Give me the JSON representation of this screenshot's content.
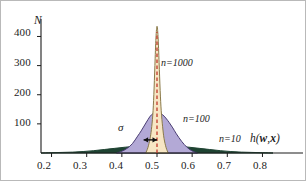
{
  "figure": {
    "background_color": "#ffffff",
    "border_color": "#b9b9b9",
    "axis_color": "#1c1c1c"
  },
  "axes": {
    "y_label": "N",
    "x_label_html": "h(<b>w</b>,<b>x</b>)",
    "x_label_text": "h(w,x)",
    "y_ticks": [
      "100",
      "200",
      "300",
      "400"
    ],
    "x_ticks": [
      "0.2",
      "0.3",
      "0.4",
      "0.5",
      "0.6",
      "0.7",
      "0.8"
    ]
  },
  "annotations": {
    "sigma": "σ",
    "sigma_arrow": "double-headed-arrow",
    "mean_line": "dashed-vertical-line-at-0.5",
    "mean_line_color": "#c0392b"
  },
  "series_labels": {
    "n1000": "n=1000",
    "n100": "n=100",
    "n10": "n=10"
  },
  "chart_data": {
    "type": "area",
    "title": "",
    "subtitle": "",
    "xlabel": "h(w,x)",
    "ylabel": "N",
    "xlim": [
      0.17,
      0.83
    ],
    "ylim": [
      0,
      460
    ],
    "x_ticks": [
      0.2,
      0.3,
      0.4,
      0.5,
      0.6,
      0.7,
      0.8
    ],
    "y_ticks": [
      100,
      200,
      300,
      400
    ],
    "grid": false,
    "legend": "inline-annotations",
    "mean": 0.5,
    "annotations": [
      {
        "text": "σ",
        "x": 0.448,
        "y": 75,
        "note": "standard deviation marker with double arrow from 0.462 to 0.500 at y=45"
      },
      {
        "text": "n=1000",
        "x": 0.545,
        "y": 330
      },
      {
        "text": "n=100",
        "x": 0.605,
        "y": 125
      },
      {
        "text": "n=10",
        "x": 0.715,
        "y": 28
      }
    ],
    "series": [
      {
        "name": "n=10",
        "color": "#1e4332",
        "fill": "#1e4332",
        "peak": 25,
        "sigma": 0.105,
        "x": [
          0.17,
          0.2,
          0.23,
          0.26,
          0.29,
          0.32,
          0.35,
          0.38,
          0.41,
          0.44,
          0.47,
          0.5,
          0.53,
          0.56,
          0.59,
          0.62,
          0.65,
          0.68,
          0.71,
          0.74,
          0.77,
          0.8,
          0.83
        ],
        "values": [
          0,
          1,
          2,
          3,
          5,
          8,
          12,
          16,
          20,
          23,
          25,
          25,
          25,
          23,
          20,
          16,
          12,
          8,
          5,
          3,
          2,
          1,
          0
        ]
      },
      {
        "name": "n=100",
        "color": "#4a3d73",
        "fill": "#b3a9d6",
        "peak": 140,
        "sigma": 0.038,
        "x": [
          0.385,
          0.4,
          0.415,
          0.43,
          0.445,
          0.455,
          0.465,
          0.475,
          0.485,
          0.5,
          0.515,
          0.525,
          0.535,
          0.545,
          0.555,
          0.57,
          0.585,
          0.6,
          0.615
        ],
        "values": [
          0,
          6,
          16,
          32,
          58,
          76,
          96,
          116,
          132,
          140,
          132,
          120,
          104,
          86,
          66,
          40,
          20,
          7,
          0
        ]
      },
      {
        "name": "n=1000",
        "color": "#8a7a4a",
        "fill": "#f7e6c4",
        "peak": 435,
        "sigma": 0.0115,
        "x": [
          0.468,
          0.474,
          0.48,
          0.484,
          0.488,
          0.491,
          0.494,
          0.497,
          0.5,
          0.503,
          0.506,
          0.509,
          0.512,
          0.516,
          0.52,
          0.526,
          0.532
        ],
        "values": [
          0,
          18,
          48,
          80,
          130,
          200,
          300,
          395,
          435,
          400,
          310,
          215,
          145,
          90,
          50,
          18,
          0
        ]
      }
    ]
  }
}
